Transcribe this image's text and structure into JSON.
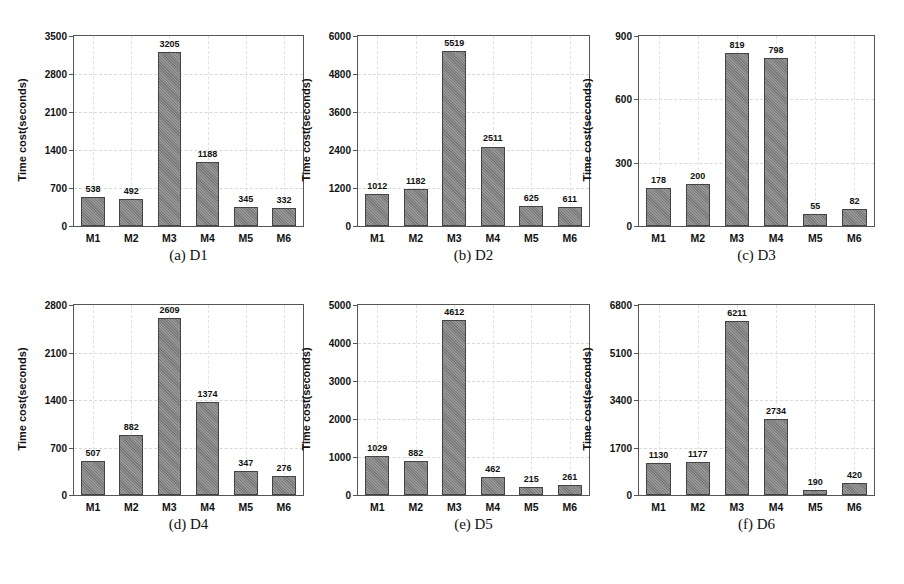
{
  "chart_data": [
    {
      "type": "bar",
      "caption": "(a) D1",
      "categories": [
        "M1",
        "M2",
        "M3",
        "M4",
        "M5",
        "M6"
      ],
      "values": [
        538,
        492,
        3205,
        1188,
        345,
        332
      ],
      "value_labels": [
        "538",
        "492",
        "3205",
        "1188",
        "345",
        "332"
      ],
      "title": "",
      "xlabel": "",
      "ylabel": "Time cost(seconds)",
      "ylim": [
        0,
        3500
      ],
      "yticks": [
        0,
        700,
        1400,
        2100,
        2800,
        3500
      ],
      "grid": true,
      "legend": null
    },
    {
      "type": "bar",
      "caption": "(b) D2",
      "categories": [
        "M1",
        "M2",
        "M3",
        "M4",
        "M5",
        "M6"
      ],
      "values": [
        1012,
        1182,
        5519,
        2511,
        625,
        611
      ],
      "value_labels": [
        "1012",
        "1182",
        "5519",
        "2511",
        "625",
        "611"
      ],
      "title": "",
      "xlabel": "",
      "ylabel": "Time cost(seconds)",
      "ylim": [
        0,
        6000
      ],
      "yticks": [
        0,
        1200,
        2400,
        3600,
        4800,
        6000
      ],
      "grid": true,
      "legend": null
    },
    {
      "type": "bar",
      "caption": "(c) D3",
      "categories": [
        "M1",
        "M2",
        "M3",
        "M4",
        "M5",
        "M6"
      ],
      "values": [
        178,
        200,
        819,
        798,
        55,
        82
      ],
      "value_labels": [
        "178",
        "200",
        "819",
        "798",
        "55",
        "82"
      ],
      "title": "",
      "xlabel": "",
      "ylabel": "Time cost(seconds)",
      "ylim": [
        0,
        900
      ],
      "yticks": [
        0,
        300,
        600,
        900
      ],
      "grid": true,
      "legend": null
    },
    {
      "type": "bar",
      "caption": "(d) D4",
      "categories": [
        "M1",
        "M2",
        "M3",
        "M4",
        "M5",
        "M6"
      ],
      "values": [
        507,
        882,
        2609,
        1374,
        347,
        276
      ],
      "value_labels": [
        "507",
        "882",
        "2609",
        "1374",
        "347",
        "276"
      ],
      "title": "",
      "xlabel": "",
      "ylabel": "Time cost(seconds)",
      "ylim": [
        0,
        2800
      ],
      "yticks": [
        0,
        700,
        1400,
        2100,
        2800
      ],
      "grid": true,
      "legend": null
    },
    {
      "type": "bar",
      "caption": "(e) D5",
      "categories": [
        "M1",
        "M2",
        "M3",
        "M4",
        "M5",
        "M6"
      ],
      "values": [
        1029,
        882,
        4612,
        462,
        215,
        261
      ],
      "value_labels": [
        "1029",
        "882",
        "4612",
        "462",
        "215",
        "261"
      ],
      "title": "",
      "xlabel": "",
      "ylabel": "Time cost(seconds)",
      "ylim": [
        0,
        5000
      ],
      "yticks": [
        0,
        1000,
        2000,
        3000,
        4000,
        5000
      ],
      "grid": true,
      "legend": null
    },
    {
      "type": "bar",
      "caption": "(f) D6",
      "categories": [
        "M1",
        "M2",
        "M3",
        "M4",
        "M5",
        "M6"
      ],
      "values": [
        1130,
        1177,
        6211,
        2734,
        190,
        420
      ],
      "value_labels": [
        "1130",
        "1177",
        "6211",
        "2734",
        "190",
        "420"
      ],
      "title": "",
      "xlabel": "",
      "ylabel": "Time cost(seconds)",
      "ylim": [
        0,
        6800
      ],
      "yticks": [
        0,
        1700,
        3400,
        5100,
        6800
      ],
      "grid": true,
      "legend": null
    }
  ],
  "style": {
    "bar_color": "#8a8a8a",
    "bar_border": "#444444",
    "frame_color": "#555555",
    "text_color": "#111111"
  }
}
